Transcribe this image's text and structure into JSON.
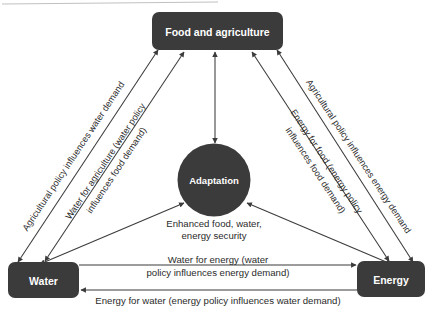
{
  "diagram": {
    "type": "nexus-diagram",
    "colors": {
      "node_fill": "#3b3b3b",
      "node_text": "#ffffff",
      "edge_stroke": "#3b3b3b",
      "label_text": "#2b2b2b",
      "background": "#ffffff",
      "artifact": "#b9b9b9"
    },
    "nodes": [
      {
        "id": "food",
        "label": "Food and agriculture",
        "shape": "rounded-rect"
      },
      {
        "id": "water",
        "label": "Water",
        "shape": "rounded-rect"
      },
      {
        "id": "energy",
        "label": "Energy",
        "shape": "rounded-rect"
      },
      {
        "id": "adaptation",
        "label": "Adaptation",
        "shape": "circle"
      }
    ],
    "notes": [
      {
        "id": "adaptation-outcome",
        "line1": "Enhanced food, water,",
        "line2": "energy security"
      }
    ],
    "edges": [
      {
        "id": "food-water-outer",
        "from": "food",
        "to": "water",
        "arrows": "both",
        "label": "Agricultural policy influences water demand",
        "orientation": "rotated"
      },
      {
        "id": "water-food-inner",
        "from": "water",
        "to": "food",
        "arrows": "both",
        "label_line1": "Water for agriculture (water policy",
        "label_line2": "influences food demand)",
        "orientation": "rotated"
      },
      {
        "id": "food-energy-outer",
        "from": "food",
        "to": "energy",
        "arrows": "both",
        "label": "Agricultural policy influences energy demand",
        "orientation": "rotated"
      },
      {
        "id": "energy-food-inner",
        "from": "energy",
        "to": "food",
        "arrows": "both",
        "label_line1": "Energy for food (energy policy",
        "label_line2": "influences food demand)",
        "orientation": "rotated"
      },
      {
        "id": "water-energy",
        "from": "water",
        "to": "energy",
        "arrows": "forward",
        "label_line1": "Water for energy (water",
        "label_line2": "policy influences energy demand)",
        "orientation": "horizontal"
      },
      {
        "id": "energy-water",
        "from": "energy",
        "to": "water",
        "arrows": "forward",
        "label": "Energy for water (energy policy influences water demand)",
        "orientation": "horizontal"
      },
      {
        "id": "food-adaptation",
        "from": "food",
        "to": "adaptation",
        "arrows": "both",
        "label": ""
      },
      {
        "id": "water-adaptation",
        "from": "water",
        "to": "adaptation",
        "arrows": "both",
        "label": ""
      },
      {
        "id": "energy-adaptation",
        "from": "energy",
        "to": "adaptation",
        "arrows": "both",
        "label": ""
      }
    ]
  }
}
